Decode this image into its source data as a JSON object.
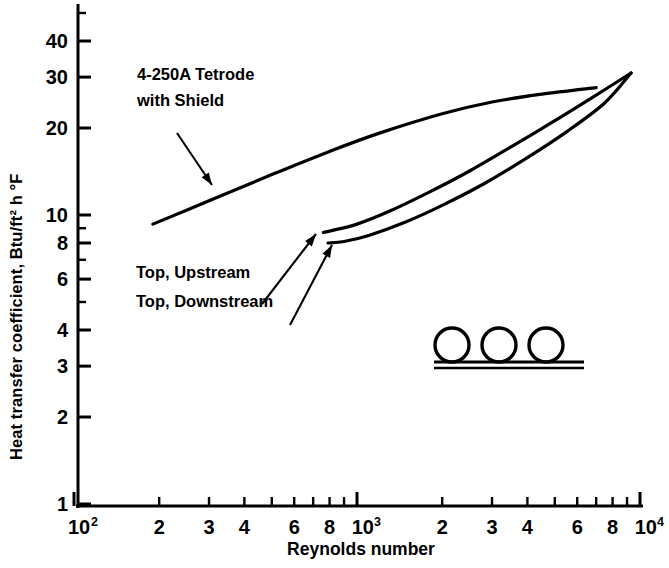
{
  "chart_data": {
    "type": "line",
    "title": "",
    "xlabel": "Reynolds number",
    "ylabel": "Heat transfer coefficient, Btu/ft² h °F",
    "xscale": "log",
    "yscale": "log",
    "xlim": [
      100,
      10000
    ],
    "ylim": [
      1,
      50
    ],
    "grid": false,
    "legend": "none",
    "xticks": [
      {
        "value": 100,
        "label": "10",
        "sup": "2",
        "major": true
      },
      {
        "value": 200,
        "label": "2",
        "sup": "",
        "major": false
      },
      {
        "value": 300,
        "label": "3",
        "sup": "",
        "major": false
      },
      {
        "value": 400,
        "label": "4",
        "sup": "",
        "major": false
      },
      {
        "value": 500,
        "label": "",
        "sup": "",
        "major": false
      },
      {
        "value": 600,
        "label": "6",
        "sup": "",
        "major": false
      },
      {
        "value": 700,
        "label": "",
        "sup": "",
        "major": false
      },
      {
        "value": 800,
        "label": "8",
        "sup": "",
        "major": false
      },
      {
        "value": 900,
        "label": "",
        "sup": "",
        "major": false
      },
      {
        "value": 1000,
        "label": "10",
        "sup": "3",
        "major": true
      },
      {
        "value": 2000,
        "label": "2",
        "sup": "",
        "major": false
      },
      {
        "value": 3000,
        "label": "3",
        "sup": "",
        "major": false
      },
      {
        "value": 4000,
        "label": "4",
        "sup": "",
        "major": false
      },
      {
        "value": 5000,
        "label": "",
        "sup": "",
        "major": false
      },
      {
        "value": 6000,
        "label": "6",
        "sup": "",
        "major": false
      },
      {
        "value": 7000,
        "label": "",
        "sup": "",
        "major": false
      },
      {
        "value": 8000,
        "label": "8",
        "sup": "",
        "major": false
      },
      {
        "value": 9000,
        "label": "",
        "sup": "",
        "major": false
      },
      {
        "value": 10000,
        "label": "10",
        "sup": "4",
        "major": true
      }
    ],
    "yticks": [
      {
        "value": 1,
        "label": "1",
        "major": true
      },
      {
        "value": 2,
        "label": "2",
        "major": true
      },
      {
        "value": 3,
        "label": "3",
        "major": true
      },
      {
        "value": 4,
        "label": "4",
        "major": true
      },
      {
        "value": 5,
        "label": "",
        "major": false
      },
      {
        "value": 6,
        "label": "6",
        "major": true
      },
      {
        "value": 7,
        "label": "",
        "major": false
      },
      {
        "value": 8,
        "label": "8",
        "major": true
      },
      {
        "value": 9,
        "label": "",
        "major": false
      },
      {
        "value": 10,
        "label": "10",
        "major": true
      },
      {
        "value": 20,
        "label": "20",
        "major": true
      },
      {
        "value": 30,
        "label": "30",
        "major": true
      },
      {
        "value": 40,
        "label": "40",
        "major": true
      },
      {
        "value": 50,
        "label": "",
        "major": false
      }
    ],
    "series": [
      {
        "name": "4-250A Tetrode with Shield",
        "points": [
          [
            190,
            9.3
          ],
          [
            300,
            11.2
          ],
          [
            500,
            13.8
          ],
          [
            800,
            16.6
          ],
          [
            1200,
            19.2
          ],
          [
            2000,
            22.4
          ],
          [
            3000,
            24.6
          ],
          [
            4500,
            26.2
          ],
          [
            7000,
            27.6
          ]
        ]
      },
      {
        "name": "Top, Upstream",
        "points": [
          [
            760,
            8.7
          ],
          [
            820,
            8.85
          ],
          [
            1000,
            9.3
          ],
          [
            1300,
            10.3
          ],
          [
            1800,
            12.0
          ],
          [
            2500,
            14.2
          ],
          [
            3500,
            17.2
          ],
          [
            5000,
            21.2
          ],
          [
            7000,
            26.0
          ],
          [
            9300,
            31.0
          ]
        ]
      },
      {
        "name": "Top, Downstream",
        "points": [
          [
            790,
            8.0
          ],
          [
            900,
            8.1
          ],
          [
            1100,
            8.5
          ],
          [
            1500,
            9.5
          ],
          [
            2000,
            10.8
          ],
          [
            2800,
            12.8
          ],
          [
            4000,
            15.8
          ],
          [
            5500,
            19.4
          ],
          [
            7500,
            24.4
          ],
          [
            9300,
            31.0
          ]
        ]
      }
    ],
    "annotations": [
      {
        "id": "tetrode",
        "lines": [
          "4-250A Tetrode",
          "with Shield"
        ],
        "text_x": 137,
        "text_y": 80,
        "arrow": {
          "x1": 177,
          "y1": 133,
          "x2": 212,
          "y2": 185
        }
      },
      {
        "id": "upstream",
        "lines": [
          "Top, Upstream"
        ],
        "text_x": 136,
        "text_y": 278,
        "arrow": {
          "x1": 262,
          "y1": 304,
          "x2": 316,
          "y2": 234
        }
      },
      {
        "id": "downstream",
        "lines": [
          "Top, Downstream"
        ],
        "text_x": 136,
        "text_y": 307,
        "arrow": {
          "x1": 290,
          "y1": 325,
          "x2": 332,
          "y2": 245
        }
      }
    ],
    "inset_diagram": {
      "name": "three-tubes-on-plate",
      "circles": [
        {
          "cx": 452,
          "cy": 345,
          "r": 17
        },
        {
          "cx": 499,
          "cy": 345,
          "r": 17
        },
        {
          "cx": 546,
          "cy": 345,
          "r": 17
        }
      ],
      "plate": {
        "x1": 434,
        "x2": 584,
        "y_top": 362,
        "y_bottom": 368
      }
    }
  }
}
